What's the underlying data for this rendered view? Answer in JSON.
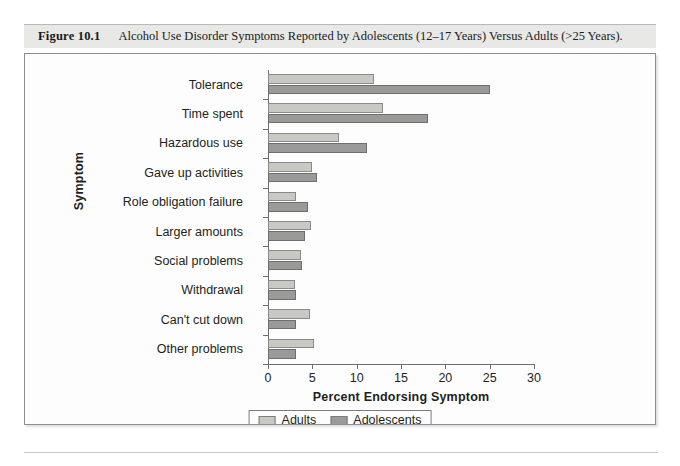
{
  "figure": {
    "number": "Figure 10.1",
    "caption": "Alcohol Use Disorder Symptoms Reported by Adolescents (12–17 Years) Versus Adults (>25 Years)."
  },
  "chart_data": {
    "type": "bar",
    "orientation": "horizontal",
    "title": "",
    "xlabel": "Percent Endorsing Symptom",
    "ylabel": "Symptom",
    "xlim": [
      0,
      30
    ],
    "xticks": [
      0,
      5,
      10,
      15,
      20,
      25,
      30
    ],
    "grid": false,
    "legend_position": "bottom-center",
    "categories": [
      "Tolerance",
      "Time spent",
      "Hazardous use",
      "Gave up activities",
      "Role obligation failure",
      "Larger amounts",
      "Social problems",
      "Withdrawal",
      "Can't cut down",
      "Other problems"
    ],
    "series": [
      {
        "name": "Adults",
        "color": "#c8c8c5",
        "values": [
          12.0,
          13.0,
          8.0,
          5.0,
          3.2,
          4.8,
          3.7,
          3.0,
          4.7,
          5.2
        ]
      },
      {
        "name": "Adolescents",
        "color": "#9a9a98",
        "values": [
          25.0,
          18.0,
          11.2,
          5.5,
          4.5,
          4.2,
          3.8,
          3.2,
          3.2,
          3.2
        ]
      }
    ]
  },
  "axis": {
    "x_title": "Percent Endorsing Symptom",
    "y_title": "Symptom",
    "tick_labels": [
      "0",
      "5",
      "10",
      "15",
      "20",
      "25",
      "30"
    ]
  },
  "legend": {
    "items": [
      {
        "label": "Adults",
        "swatch": "adults"
      },
      {
        "label": "Adolescents",
        "swatch": "adolescents"
      }
    ]
  }
}
